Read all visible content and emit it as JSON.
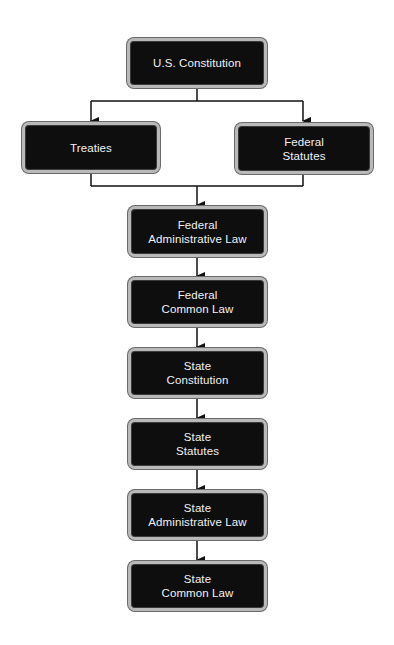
{
  "diagram": {
    "colors": {
      "node_fill": "#0e0e0e",
      "node_border": "#b9b9b9",
      "node_text": "#f2f2f2",
      "connector": "#111111",
      "background": "#ffffff"
    },
    "nodes": [
      {
        "id": "us-constitution",
        "lines": [
          "U.S. Constitution"
        ]
      },
      {
        "id": "treaties",
        "lines": [
          "Treaties"
        ]
      },
      {
        "id": "federal-statutes",
        "lines": [
          "Federal",
          "Statutes"
        ]
      },
      {
        "id": "federal-administrative-law",
        "lines": [
          "Federal",
          "Administrative Law"
        ]
      },
      {
        "id": "federal-common-law",
        "lines": [
          "Federal",
          "Common Law"
        ]
      },
      {
        "id": "state-constitution",
        "lines": [
          "State",
          "Constitution"
        ]
      },
      {
        "id": "state-statutes",
        "lines": [
          "State",
          "Statutes"
        ]
      },
      {
        "id": "state-administrative-law",
        "lines": [
          "State",
          "Administrative Law"
        ]
      },
      {
        "id": "state-common-law",
        "lines": [
          "State",
          "Common Law"
        ]
      }
    ],
    "edges": [
      {
        "from": "us-constitution",
        "to": "treaties"
      },
      {
        "from": "us-constitution",
        "to": "federal-statutes"
      },
      {
        "from": "treaties",
        "to": "federal-administrative-law"
      },
      {
        "from": "federal-statutes",
        "to": "federal-administrative-law"
      },
      {
        "from": "federal-administrative-law",
        "to": "federal-common-law"
      },
      {
        "from": "federal-common-law",
        "to": "state-constitution"
      },
      {
        "from": "state-constitution",
        "to": "state-statutes"
      },
      {
        "from": "state-statutes",
        "to": "state-administrative-law"
      },
      {
        "from": "state-administrative-law",
        "to": "state-common-law"
      }
    ]
  }
}
